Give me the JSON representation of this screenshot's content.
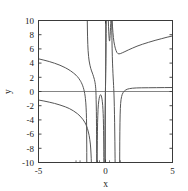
{
  "chart_data": {
    "type": "line",
    "title": "",
    "xlabel": "x",
    "ylabel": "y",
    "xlim": [
      -5,
      5
    ],
    "ylim": [
      -10,
      10
    ],
    "grid": false,
    "legend": null,
    "x_ticks": [
      -5,
      0,
      5
    ],
    "x_tick_labels": [
      "-5",
      "0",
      "5"
    ],
    "x_minor_ticks": [
      -2.2,
      -1.9,
      -0.6,
      -0.45,
      0.3,
      1.1
    ],
    "y_ticks": [
      -10,
      -8,
      -6,
      -4,
      -2,
      0,
      2,
      4,
      6,
      8,
      10
    ],
    "y_tick_labels": [
      "-10",
      "-8",
      "-6",
      "-4",
      "-2",
      "0",
      "2",
      "4",
      "6",
      "8",
      "10"
    ],
    "zero_line_y": 0,
    "line_color": "#555555",
    "axis_color": "#3a3a3a",
    "background": "#ffffff",
    "series": [
      {
        "name": "branch-left-upper",
        "comment": "starts near (-5, 4.6), decreases through zero near x=-1.55, falls to -10 near x=-1.9",
        "points": [
          [
            -5,
            4.6
          ],
          [
            -4.6,
            4.42
          ],
          [
            -4.2,
            4.22
          ],
          [
            -3.8,
            3.98
          ],
          [
            -3.4,
            3.7
          ],
          [
            -3.0,
            3.35
          ],
          [
            -2.8,
            3.14
          ],
          [
            -2.6,
            2.9
          ],
          [
            -2.4,
            2.62
          ],
          [
            -2.2,
            2.3
          ],
          [
            -2.1,
            2.1
          ],
          [
            -2.0,
            1.86
          ],
          [
            -1.9,
            1.58
          ],
          [
            -1.85,
            1.42
          ],
          [
            -1.8,
            1.24
          ],
          [
            -1.75,
            1.04
          ],
          [
            -1.7,
            0.8
          ],
          [
            -1.66,
            0.58
          ],
          [
            -1.62,
            0.32
          ],
          [
            -1.58,
            0.0
          ],
          [
            -1.55,
            -0.3
          ],
          [
            -1.52,
            -0.65
          ],
          [
            -1.5,
            -1.0
          ],
          [
            -1.47,
            -1.6
          ],
          [
            -1.45,
            -2.2
          ],
          [
            -1.43,
            -3.0
          ],
          [
            -1.42,
            -3.8
          ],
          [
            -1.41,
            -4.8
          ],
          [
            -1.405,
            -6.0
          ],
          [
            -1.4,
            -7.4
          ],
          [
            -1.398,
            -8.6
          ],
          [
            -1.396,
            -10
          ]
        ]
      },
      {
        "name": "branch-left-lower",
        "comment": "starts near (-5, -1.2), decreases slowly then plunges to -10 near x=-1.15",
        "points": [
          [
            -5,
            -1.2
          ],
          [
            -4.6,
            -1.34
          ],
          [
            -4.2,
            -1.5
          ],
          [
            -3.8,
            -1.68
          ],
          [
            -3.4,
            -1.9
          ],
          [
            -3.0,
            -2.16
          ],
          [
            -2.7,
            -2.4
          ],
          [
            -2.4,
            -2.72
          ],
          [
            -2.1,
            -3.12
          ],
          [
            -1.9,
            -3.46
          ],
          [
            -1.7,
            -3.9
          ],
          [
            -1.55,
            -4.32
          ],
          [
            -1.45,
            -4.7
          ],
          [
            -1.35,
            -5.2
          ],
          [
            -1.28,
            -5.7
          ],
          [
            -1.22,
            -6.2
          ],
          [
            -1.17,
            -6.8
          ],
          [
            -1.13,
            -7.4
          ],
          [
            -1.1,
            -8.1
          ],
          [
            -1.08,
            -8.8
          ],
          [
            -1.065,
            -9.4
          ],
          [
            -1.055,
            -10
          ]
        ]
      },
      {
        "name": "branch-mid-upper",
        "comment": "enters top at x=-1.36 falling steeply, crosses zero near x=-0.72, plunges to -10 near x=-0.58",
        "points": [
          [
            -1.36,
            10
          ],
          [
            -1.35,
            8.8
          ],
          [
            -1.34,
            7.8
          ],
          [
            -1.32,
            6.6
          ],
          [
            -1.3,
            5.8
          ],
          [
            -1.26,
            4.9
          ],
          [
            -1.22,
            4.3
          ],
          [
            -1.16,
            3.7
          ],
          [
            -1.1,
            3.25
          ],
          [
            -1.04,
            2.9
          ],
          [
            -0.98,
            2.6
          ],
          [
            -0.94,
            2.38
          ],
          [
            -0.9,
            2.15
          ],
          [
            -0.86,
            1.9
          ],
          [
            -0.83,
            1.7
          ],
          [
            -0.8,
            1.45
          ],
          [
            -0.78,
            1.24
          ],
          [
            -0.76,
            1.0
          ],
          [
            -0.745,
            0.75
          ],
          [
            -0.73,
            0.45
          ],
          [
            -0.72,
            0.15
          ],
          [
            -0.712,
            -0.2
          ],
          [
            -0.705,
            -0.6
          ],
          [
            -0.7,
            -1.1
          ],
          [
            -0.69,
            -1.9
          ],
          [
            -0.682,
            -2.8
          ],
          [
            -0.676,
            -3.8
          ],
          [
            -0.671,
            -4.9
          ],
          [
            -0.667,
            -6.1
          ],
          [
            -0.664,
            -7.4
          ],
          [
            -0.662,
            -8.7
          ],
          [
            -0.66,
            -10
          ]
        ]
      },
      {
        "name": "branch-hump-near-zero",
        "comment": "rises from -10 at x=-0.62, peaks around y=-0.45 near x=-0.38, falls to -10 at x=-0.12",
        "points": [
          [
            -0.62,
            -10
          ],
          [
            -0.615,
            -8.4
          ],
          [
            -0.608,
            -6.9
          ],
          [
            -0.6,
            -5.6
          ],
          [
            -0.59,
            -4.4
          ],
          [
            -0.575,
            -3.4
          ],
          [
            -0.555,
            -2.5
          ],
          [
            -0.53,
            -1.8
          ],
          [
            -0.5,
            -1.3
          ],
          [
            -0.47,
            -0.95
          ],
          [
            -0.44,
            -0.7
          ],
          [
            -0.41,
            -0.54
          ],
          [
            -0.38,
            -0.46
          ],
          [
            -0.35,
            -0.47
          ],
          [
            -0.32,
            -0.58
          ],
          [
            -0.29,
            -0.78
          ],
          [
            -0.26,
            -1.08
          ],
          [
            -0.235,
            -1.45
          ],
          [
            -0.21,
            -1.95
          ],
          [
            -0.19,
            -2.5
          ],
          [
            -0.175,
            -3.1
          ],
          [
            -0.162,
            -3.8
          ],
          [
            -0.152,
            -4.6
          ],
          [
            -0.144,
            -5.5
          ],
          [
            -0.138,
            -6.4
          ],
          [
            -0.133,
            -7.4
          ],
          [
            -0.129,
            -8.4
          ],
          [
            -0.126,
            -9.3
          ],
          [
            -0.124,
            -10
          ]
        ]
      },
      {
        "name": "branch-origin-up",
        "comment": "near-vertical spike: comes up from -10 just left of 0 and exits top at x=0.06",
        "points": [
          [
            -0.055,
            -10
          ],
          [
            -0.052,
            -8.2
          ],
          [
            -0.048,
            -6.4
          ],
          [
            -0.043,
            -4.8
          ],
          [
            -0.037,
            -3.3
          ],
          [
            -0.029,
            -2.0
          ],
          [
            -0.02,
            -0.9
          ],
          [
            -0.01,
            -0.1
          ],
          [
            0.0,
            0.7
          ],
          [
            0.012,
            1.6
          ],
          [
            0.022,
            2.5
          ],
          [
            0.032,
            3.5
          ],
          [
            0.04,
            4.6
          ],
          [
            0.046,
            5.7
          ],
          [
            0.051,
            6.9
          ],
          [
            0.055,
            8.2
          ],
          [
            0.058,
            9.2
          ],
          [
            0.06,
            10
          ]
        ]
      },
      {
        "name": "branch-narrow-u-top",
        "comment": "narrow U near the top: descends from y=10 at x=0.21 to minimum y=7.1 at x=0.30, back up to y=10 at x=0.40",
        "points": [
          [
            0.21,
            10
          ],
          [
            0.225,
            9.2
          ],
          [
            0.24,
            8.5
          ],
          [
            0.255,
            7.95
          ],
          [
            0.27,
            7.5
          ],
          [
            0.285,
            7.22
          ],
          [
            0.3,
            7.1
          ],
          [
            0.315,
            7.2
          ],
          [
            0.33,
            7.48
          ],
          [
            0.345,
            7.9
          ],
          [
            0.36,
            8.4
          ],
          [
            0.375,
            9.0
          ],
          [
            0.39,
            9.6
          ],
          [
            0.4,
            10
          ]
        ]
      },
      {
        "name": "branch-right-descend",
        "comment": "enters top at x=0.46, falls steeply past y=0 near x=0.62 down to -10 near x=0.72",
        "points": [
          [
            0.46,
            10
          ],
          [
            0.47,
            8.6
          ],
          [
            0.482,
            7.2
          ],
          [
            0.495,
            6.0
          ],
          [
            0.51,
            4.9
          ],
          [
            0.525,
            4.0
          ],
          [
            0.542,
            3.2
          ],
          [
            0.558,
            2.5
          ],
          [
            0.574,
            1.9
          ],
          [
            0.59,
            1.35
          ],
          [
            0.603,
            0.85
          ],
          [
            0.614,
            0.4
          ],
          [
            0.624,
            0.0
          ],
          [
            0.634,
            -0.5
          ],
          [
            0.646,
            -1.2
          ],
          [
            0.658,
            -2.1
          ],
          [
            0.67,
            -3.2
          ],
          [
            0.681,
            -4.4
          ],
          [
            0.691,
            -5.7
          ],
          [
            0.7,
            -7.0
          ],
          [
            0.708,
            -8.4
          ],
          [
            0.714,
            -9.4
          ],
          [
            0.718,
            -10
          ]
        ]
      },
      {
        "name": "branch-right-well",
        "comment": "comes up from -10 at x=1.06, rises past zero and approaches ~0.5 asymptotically to x=5",
        "points": [
          [
            1.06,
            -10
          ],
          [
            1.062,
            -8.5
          ],
          [
            1.066,
            -7.0
          ],
          [
            1.072,
            -5.6
          ],
          [
            1.08,
            -4.4
          ],
          [
            1.092,
            -3.3
          ],
          [
            1.108,
            -2.4
          ],
          [
            1.13,
            -1.7
          ],
          [
            1.16,
            -1.15
          ],
          [
            1.2,
            -0.72
          ],
          [
            1.25,
            -0.4
          ],
          [
            1.32,
            -0.14
          ],
          [
            1.4,
            0.05
          ],
          [
            1.5,
            0.2
          ],
          [
            1.62,
            0.32
          ],
          [
            1.78,
            0.4
          ],
          [
            2.0,
            0.46
          ],
          [
            2.3,
            0.5
          ],
          [
            2.7,
            0.52
          ],
          [
            3.2,
            0.53
          ],
          [
            3.8,
            0.54
          ],
          [
            4.4,
            0.55
          ],
          [
            5.0,
            0.56
          ]
        ]
      },
      {
        "name": "branch-right-rise",
        "comment": "comes down from top at x=0.50 region, bottoms near y=5.3 at x=0.95 then rises steadily to y=7.8 at x=5",
        "points": [
          [
            0.5,
            10
          ],
          [
            0.525,
            9.1
          ],
          [
            0.555,
            8.3
          ],
          [
            0.59,
            7.6
          ],
          [
            0.63,
            7.0
          ],
          [
            0.68,
            6.5
          ],
          [
            0.73,
            6.1
          ],
          [
            0.79,
            5.75
          ],
          [
            0.85,
            5.5
          ],
          [
            0.92,
            5.35
          ],
          [
            1.0,
            5.3
          ],
          [
            1.1,
            5.33
          ],
          [
            1.25,
            5.45
          ],
          [
            1.45,
            5.62
          ],
          [
            1.7,
            5.85
          ],
          [
            2.0,
            6.1
          ],
          [
            2.35,
            6.38
          ],
          [
            2.75,
            6.65
          ],
          [
            3.2,
            6.92
          ],
          [
            3.7,
            7.2
          ],
          [
            4.2,
            7.45
          ],
          [
            4.6,
            7.65
          ],
          [
            5.0,
            7.82
          ]
        ]
      }
    ]
  }
}
